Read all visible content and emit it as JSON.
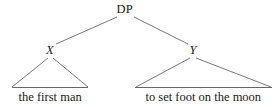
{
  "figure": {
    "type": "syntax-tree",
    "background_color": "#ffffff",
    "line_color": "#555555",
    "text_color": "#1a1a1a"
  },
  "tree": {
    "root": {
      "label": "DP",
      "x": 125,
      "y": 9
    },
    "children": [
      {
        "label": "X",
        "style": "italic",
        "x": 50,
        "y": 50,
        "terminal": {
          "text": "the first man",
          "triangle_left_x": 12,
          "triangle_right_x": 88,
          "baseline_y": 88,
          "text_y": 91
        }
      },
      {
        "label": "Y",
        "style": "italic",
        "x": 193,
        "y": 50,
        "terminal": {
          "text": "to set foot on the moon",
          "triangle_left_x": 135,
          "triangle_right_x": 272,
          "baseline_y": 88,
          "text_y": 91
        }
      }
    ]
  },
  "edges": [
    {
      "name": "root-to-left",
      "from": "DP",
      "to": "X"
    },
    {
      "name": "root-to-right",
      "from": "DP",
      "to": "Y"
    }
  ]
}
